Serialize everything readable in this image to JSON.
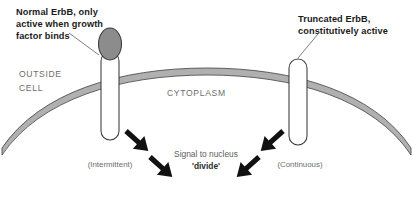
{
  "diagram": {
    "title_context": "ErbB receptor signaling across the cell membrane",
    "annotations": {
      "left_callout": {
        "line1": "Normal ErbB, only",
        "line2": "active when growth",
        "line3": "factor binds"
      },
      "right_callout": {
        "line1": "Truncated ErbB,",
        "line2": "constitutively active"
      }
    },
    "compartments": {
      "outside_line1": "OUTSIDE",
      "outside_line2": "CELL",
      "cytoplasm": "CYTOPLASM"
    },
    "signal": {
      "line1": "Signal to nucleus",
      "line2": "'divide'"
    },
    "modes": {
      "left": "(Intermittent)",
      "right": "(Continuous)"
    },
    "colors": {
      "background": "#ffffff",
      "membrane_fill": "#b0b0b0",
      "membrane_stroke": "#4a4a4a",
      "receptor_head_fill": "#8c8c8c",
      "receptor_stem_fill": "#ffffff",
      "receptor_stroke": "#3a3a3a",
      "arrow_fill": "#111111",
      "callout_text": "#1a1a1a",
      "muted_text": "#6d6d6d",
      "leader_line": "#6f6f6f"
    },
    "icons": {
      "left_receptor": "normal-erbb-receptor-icon",
      "right_receptor": "truncated-erbb-receptor-icon",
      "membrane": "cell-membrane-icon",
      "arrows": "signal-arrow-icon"
    }
  }
}
